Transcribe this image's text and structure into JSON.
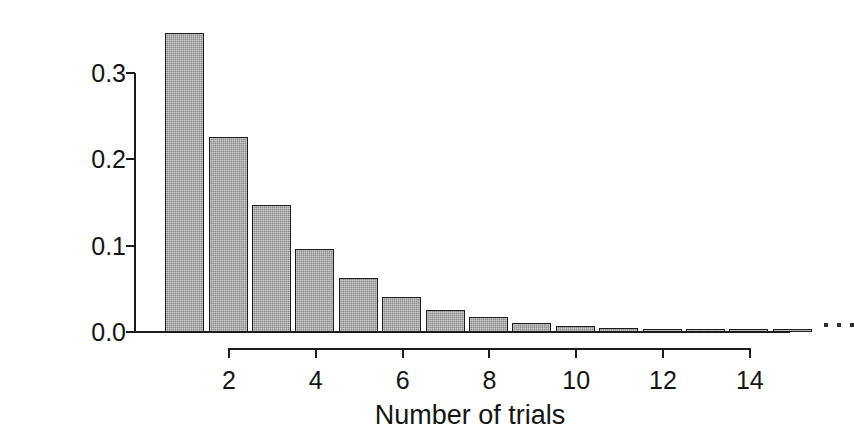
{
  "chart_data": {
    "type": "bar",
    "title": "",
    "subtitle": "",
    "xlabel": "Number of trials",
    "ylabel": "Probability",
    "categories": [
      1,
      2,
      3,
      4,
      5,
      6,
      7,
      8,
      9,
      10,
      11,
      12,
      13,
      14,
      15
    ],
    "values": [
      0.347,
      0.226,
      0.147,
      0.096,
      0.062,
      0.04,
      0.026,
      0.017,
      0.011,
      0.007,
      0.005,
      0.003,
      0.002,
      0.0013,
      0.0008
    ],
    "x": [
      1,
      2,
      3,
      4,
      5,
      6,
      7,
      8,
      9,
      10,
      11,
      12,
      13,
      14,
      15
    ],
    "xlim": [
      0.4,
      15.6
    ],
    "ylim": [
      0.0,
      0.36
    ],
    "x_ticks": [
      2,
      4,
      6,
      8,
      10,
      12,
      14
    ],
    "x_tick_labels": [
      "2",
      "4",
      "6",
      "8",
      "10",
      "12",
      "14"
    ],
    "y_ticks": [
      0.0,
      0.1,
      0.2,
      0.3
    ],
    "y_tick_labels": [
      "0.0",
      "0.1",
      "0.2",
      "0.3"
    ],
    "grid": false,
    "legend": null,
    "annotations": [
      "ellipsis-dots-after-last-bar"
    ],
    "bar_color": "#8c8c8c",
    "bar_edge_color": "#1c1c1c",
    "axis_color": "#1c1c1c",
    "background": "#ffffff",
    "distribution_note": "geometric, p = 0.35"
  },
  "axes": {
    "y_title": "Probability",
    "x_title": "Number of trials",
    "y_tick_labels": [
      "0.3",
      "0.2",
      "0.1",
      "0.0"
    ],
    "x_tick_labels": [
      "2",
      "4",
      "6",
      "8",
      "10",
      "12",
      "14"
    ]
  }
}
